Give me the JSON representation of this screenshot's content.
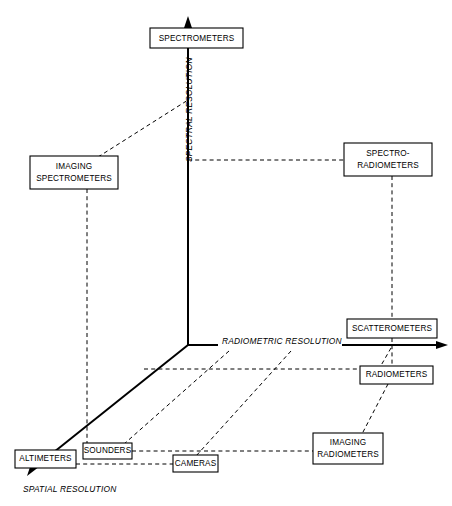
{
  "diagram": {
    "axes": [
      {
        "id": "spectral",
        "label": "SPECTRAL RESOLUTION",
        "direction": "up",
        "label_rotation": -90
      },
      {
        "id": "radiometric",
        "label": "RADIOMETRIC RESOLUTION",
        "direction": "right",
        "label_rotation": 0
      },
      {
        "id": "spatial",
        "label": "SPATIAL RESOLUTION",
        "direction": "down-left",
        "label_rotation": 0
      }
    ],
    "nodes": [
      {
        "id": "spectrometers",
        "label": "SPECTROMETERS",
        "lines": [
          "SPECTROMETERS"
        ]
      },
      {
        "id": "imaging-spectrometers",
        "label": "IMAGING SPECTROMETERS",
        "lines": [
          "IMAGING",
          "SPECTROMETERS"
        ]
      },
      {
        "id": "spectro-radiometers",
        "label": "SPECTRO-RADIOMETERS",
        "lines": [
          "SPECTRO-",
          "RADIOMETERS"
        ]
      },
      {
        "id": "scatterometers",
        "label": "SCATTEROMETERS",
        "lines": [
          "SCATTEROMETERS"
        ]
      },
      {
        "id": "radiometers",
        "label": "RADIOMETERS",
        "lines": [
          "RADIOMETERS"
        ]
      },
      {
        "id": "imaging-radiometers",
        "label": "IMAGING RADIOMETERS",
        "lines": [
          "IMAGING",
          "RADIOMETERS"
        ]
      },
      {
        "id": "altimeters",
        "label": "ALTIMETERS",
        "lines": [
          "ALTIMETERS"
        ]
      },
      {
        "id": "sounders",
        "label": "SOUNDERS",
        "lines": [
          "SOUNDERS"
        ]
      },
      {
        "id": "cameras",
        "label": "CAMERAS",
        "lines": [
          "CAMERAS"
        ]
      }
    ],
    "colors": {
      "line": "#000000",
      "box_fill": "#ffffff",
      "background": "#ffffff"
    }
  }
}
